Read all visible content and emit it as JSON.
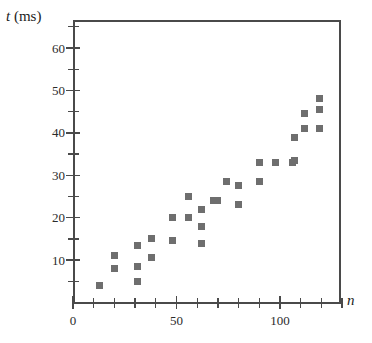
{
  "chart_data": {
    "type": "scatter",
    "title": "",
    "xlabel": "n",
    "ylabel": "t (ms)",
    "ylabel_variable": "t",
    "ylabel_unit": "(ms)",
    "xlim": [
      0,
      130
    ],
    "ylim": [
      0,
      65
    ],
    "x_major_ticks": [
      0,
      50,
      100
    ],
    "x_major_tick_labels": [
      "0",
      "50",
      "100"
    ],
    "x_minor_tick_interval": 10,
    "y_major_ticks": [
      10,
      20,
      30,
      40,
      50,
      60
    ],
    "y_major_tick_labels": [
      "10",
      "20",
      "30",
      "40",
      "50",
      "60"
    ],
    "y_minor_tick_interval": 5,
    "grid": false,
    "legend": null,
    "marker": "square",
    "marker_color": "#6e6e6e",
    "axis_color": "#4a4a4a",
    "points": [
      {
        "n": 13,
        "t": 4
      },
      {
        "n": 20,
        "t": 11
      },
      {
        "n": 20,
        "t": 8
      },
      {
        "n": 31,
        "t": 13.5
      },
      {
        "n": 31,
        "t": 8.5
      },
      {
        "n": 31,
        "t": 5
      },
      {
        "n": 38,
        "t": 15
      },
      {
        "n": 38,
        "t": 10.5
      },
      {
        "n": 48,
        "t": 20
      },
      {
        "n": 48,
        "t": 14.5
      },
      {
        "n": 56,
        "t": 25
      },
      {
        "n": 56,
        "t": 20
      },
      {
        "n": 62,
        "t": 22
      },
      {
        "n": 62,
        "t": 18
      },
      {
        "n": 62,
        "t": 14
      },
      {
        "n": 68,
        "t": 24
      },
      {
        "n": 70,
        "t": 24
      },
      {
        "n": 74,
        "t": 28.5
      },
      {
        "n": 80,
        "t": 27.5
      },
      {
        "n": 80,
        "t": 23
      },
      {
        "n": 90,
        "t": 33
      },
      {
        "n": 90,
        "t": 28.5
      },
      {
        "n": 98,
        "t": 33
      },
      {
        "n": 106,
        "t": 33
      },
      {
        "n": 107,
        "t": 39
      },
      {
        "n": 107,
        "t": 33.5
      },
      {
        "n": 112,
        "t": 44.5
      },
      {
        "n": 112,
        "t": 41
      },
      {
        "n": 119,
        "t": 48
      },
      {
        "n": 119,
        "t": 45.5
      },
      {
        "n": 119,
        "t": 41
      }
    ]
  }
}
